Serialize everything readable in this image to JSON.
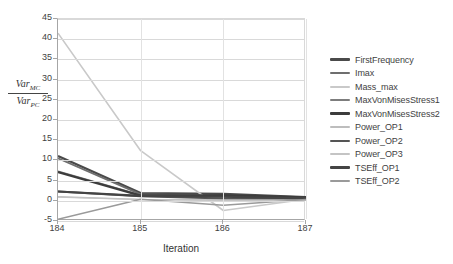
{
  "chart_data": {
    "type": "line",
    "title": "",
    "subtitle": "",
    "xlabel": "Iteration",
    "ylabel": "Var_MC / Var_PC",
    "ylabel_numerator": "Var",
    "ylabel_numerator_sub": "MC",
    "ylabel_denominator": "Var",
    "ylabel_denominator_sub": "PC",
    "x": [
      184,
      185,
      186,
      187
    ],
    "xtick_labels": [
      "184",
      "185",
      "186",
      "187"
    ],
    "ytick_labels": [
      "45",
      "40",
      "35",
      "30",
      "25",
      "20",
      "15",
      "10",
      "5",
      "0",
      "-5"
    ],
    "ytick_values": [
      45,
      40,
      35,
      30,
      25,
      20,
      15,
      10,
      5,
      0,
      -5
    ],
    "ylim": [
      -5,
      45
    ],
    "ystep": 5,
    "grid": "horizontal",
    "legend_position": "right",
    "series": [
      {
        "name": "FirstFrequency",
        "values": [
          11.1,
          1.9,
          1.7,
          0.9
        ],
        "color": "#4a4a4a",
        "width": 2.2
      },
      {
        "name": "Imax",
        "values": [
          10.5,
          1.6,
          1.2,
          0.7
        ],
        "color": "#6e6e6e",
        "width": 1.8
      },
      {
        "name": "Mass_max",
        "values": [
          41.5,
          12.4,
          -2.4,
          0.4
        ],
        "color": "#c9c9c9",
        "width": 1.6
      },
      {
        "name": "MaxVonMisesStress1",
        "values": [
          7.3,
          1.4,
          1.0,
          0.6
        ],
        "color": "#7d7d7d",
        "width": 1.6
      },
      {
        "name": "MaxVonMisesStress2",
        "values": [
          7.1,
          1.3,
          1.3,
          0.8
        ],
        "color": "#3c3c3c",
        "width": 2.4
      },
      {
        "name": "Power_OP1",
        "values": [
          1.0,
          0.35,
          0.2,
          0.2
        ],
        "color": "#bdbdbd",
        "width": 1.4
      },
      {
        "name": "Power_OP2",
        "values": [
          2.3,
          1.1,
          0.6,
          0.5
        ],
        "color": "#555555",
        "width": 2.0
      },
      {
        "name": "Power_OP3",
        "values": [
          0.9,
          0.3,
          0.15,
          0.15
        ],
        "color": "#c4c4c4",
        "width": 1.4
      },
      {
        "name": "TSEff_OP1",
        "values": [
          2.3,
          1.2,
          1.0,
          0.6
        ],
        "color": "#444444",
        "width": 2.2
      },
      {
        "name": "TSEff_OP2",
        "values": [
          -4.6,
          0.4,
          -1.1,
          0.3
        ],
        "color": "#9a9a9a",
        "width": 1.5
      }
    ]
  },
  "legend": {
    "items": [
      {
        "label": "FirstFrequency"
      },
      {
        "label": "Imax"
      },
      {
        "label": "Mass_max"
      },
      {
        "label": "MaxVonMisesStress1"
      },
      {
        "label": "MaxVonMisesStress2"
      },
      {
        "label": "Power_OP1"
      },
      {
        "label": "Power_OP2"
      },
      {
        "label": "Power_OP3"
      },
      {
        "label": "TSEff_OP1"
      },
      {
        "label": "TSEff_OP2"
      }
    ]
  },
  "footer": {
    "ghost_text": ""
  }
}
